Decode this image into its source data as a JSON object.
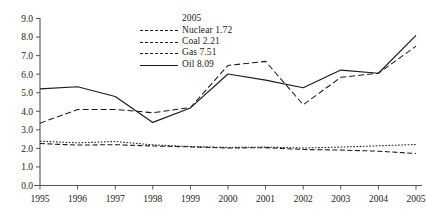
{
  "chart_data": {
    "type": "line",
    "title": "",
    "xlabel": "",
    "ylabel": "",
    "x": [
      1995,
      1996,
      1997,
      1998,
      1999,
      2000,
      2001,
      2002,
      2003,
      2004,
      2005
    ],
    "categories": [
      "1995",
      "1996",
      "1997",
      "1998",
      "1999",
      "2000",
      "2001",
      "2002",
      "2003",
      "2004",
      "2005"
    ],
    "ylim": [
      0.0,
      9.0
    ],
    "yticks": [
      "0.0",
      "1.0",
      "2.0",
      "3.0",
      "4.0",
      "5.0",
      "6.0",
      "7.0",
      "8.0",
      "9.0"
    ],
    "ytick_values": [
      0.0,
      1.0,
      2.0,
      3.0,
      4.0,
      5.0,
      6.0,
      7.0,
      8.0,
      9.0
    ],
    "grid": false,
    "legend_position": "top-center",
    "legend_title": "2005",
    "series": [
      {
        "name": "Nuclear",
        "legend_label": "Nuclear 1.72",
        "final_value": 1.72,
        "style": "dashed",
        "values": [
          2.26,
          2.18,
          2.2,
          2.13,
          2.08,
          2.02,
          2.04,
          1.94,
          1.91,
          1.85,
          1.72
        ]
      },
      {
        "name": "Coal",
        "legend_label": "Coal 2.21",
        "final_value": 2.21,
        "style": "dotted",
        "values": [
          2.39,
          2.3,
          2.37,
          2.19,
          2.1,
          2.05,
          2.07,
          2.02,
          2.07,
          2.14,
          2.21
        ]
      },
      {
        "name": "Gas",
        "legend_label": "Gas 7.51",
        "final_value": 7.51,
        "style": "dashed-long",
        "values": [
          3.36,
          4.09,
          4.1,
          3.92,
          4.2,
          6.47,
          6.69,
          4.35,
          5.83,
          6.05,
          7.51
        ]
      },
      {
        "name": "Oil",
        "legend_label": "Oil 8.09",
        "final_value": 8.09,
        "style": "solid",
        "values": [
          5.21,
          5.32,
          4.8,
          3.4,
          4.18,
          6.01,
          5.68,
          5.27,
          6.22,
          6.05,
          8.09
        ]
      }
    ]
  },
  "axis": {
    "y_tick_labels": [
      "9.0",
      "8.0",
      "7.0",
      "6.0",
      "5.0",
      "4.0",
      "3.0",
      "2.0",
      "1.0",
      "0.0"
    ],
    "x_tick_labels": [
      "1995",
      "1996",
      "1997",
      "1998",
      "1999",
      "2000",
      "2001",
      "2002",
      "2003",
      "2004",
      "2005"
    ]
  },
  "legend": {
    "title": "2005",
    "items": [
      {
        "label": "Nuclear 1.72"
      },
      {
        "label": "Coal 2.21"
      },
      {
        "label": "Gas 7.51"
      },
      {
        "label": "Oil 8.09"
      }
    ]
  },
  "colors": {
    "line": "#1a1a1a",
    "axis": "#555555",
    "background": "#ffffff"
  }
}
